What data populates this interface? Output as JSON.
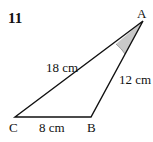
{
  "problem_number": "11",
  "vertices": {
    "A": {
      "label": "A",
      "x": 143,
      "y": 21
    },
    "B": {
      "label": "B",
      "x": 91,
      "y": 117
    },
    "C": {
      "label": "C",
      "x": 15,
      "y": 117
    }
  },
  "sides": {
    "CA": "18 cm",
    "AB": "12 cm",
    "CB": "8 cm"
  },
  "angle_marked": "A",
  "colors": {
    "line": "#111111",
    "angle_fill": "#c8c8c8"
  }
}
